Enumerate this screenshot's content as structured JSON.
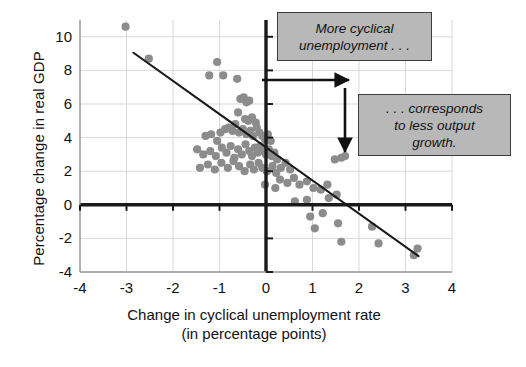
{
  "chart_data": {
    "type": "scatter",
    "title": "",
    "xlabel": "Change in cyclical unemployment rate (in percentage points)",
    "xlabel_line1": "Change in cyclical unemployment rate",
    "xlabel_line2": "(in percentage points)",
    "ylabel": "Percentage change in real GDP",
    "xlim": [
      -4,
      4
    ],
    "ylim": [
      -4,
      11
    ],
    "xticks": [
      -4,
      -3,
      -2,
      -1,
      0,
      1,
      2,
      3,
      4
    ],
    "xtick_labels": [
      "-4",
      "-3",
      "-2",
      "-1",
      "0",
      "1",
      "2",
      "3",
      "4"
    ],
    "yticks": [
      -4,
      -2,
      0,
      2,
      4,
      6,
      8,
      10
    ],
    "ytick_labels": [
      "-4",
      "-2",
      "0",
      "2",
      "4",
      "6",
      "8",
      "10"
    ],
    "grid": true,
    "legend": "none",
    "point_color": "#8c8c8c",
    "line_color": "#1a1a1a",
    "axis_color": "#1a1a1a",
    "grid_color": "#d9d9d9",
    "points": [
      [
        -3.02,
        10.6
      ],
      [
        -2.52,
        8.7
      ],
      [
        -1.05,
        8.5
      ],
      [
        -1.22,
        7.7
      ],
      [
        -0.92,
        7.7
      ],
      [
        -0.62,
        7.5
      ],
      [
        -0.55,
        6.3
      ],
      [
        -0.48,
        6.4
      ],
      [
        -0.42,
        6.1
      ],
      [
        -0.36,
        6.2
      ],
      [
        -0.6,
        5.5
      ],
      [
        -0.45,
        5.1
      ],
      [
        -0.38,
        5.0
      ],
      [
        -0.3,
        5.2
      ],
      [
        -0.22,
        4.9
      ],
      [
        -1.3,
        4.1
      ],
      [
        -1.18,
        4.2
      ],
      [
        -1.05,
        3.8
      ],
      [
        -0.98,
        4.3
      ],
      [
        -0.88,
        4.5
      ],
      [
        -0.8,
        4.6
      ],
      [
        -0.72,
        4.4
      ],
      [
        -0.66,
        4.8
      ],
      [
        -0.58,
        4.3
      ],
      [
        -0.5,
        4.5
      ],
      [
        -0.42,
        4.2
      ],
      [
        -0.34,
        4.4
      ],
      [
        -0.28,
        4.1
      ],
      [
        -0.2,
        4.6
      ],
      [
        -0.14,
        4.3
      ],
      [
        -0.08,
        4.1
      ],
      [
        -0.02,
        3.9
      ],
      [
        0.04,
        4.2
      ],
      [
        0.1,
        3.8
      ],
      [
        -1.48,
        3.3
      ],
      [
        -1.35,
        3.0
      ],
      [
        -1.2,
        3.2
      ],
      [
        -1.08,
        2.9
      ],
      [
        -0.95,
        3.4
      ],
      [
        -0.85,
        3.1
      ],
      [
        -0.76,
        3.5
      ],
      [
        -0.68,
        2.8
      ],
      [
        -0.6,
        3.3
      ],
      [
        -0.52,
        3.0
      ],
      [
        -0.44,
        3.6
      ],
      [
        -0.36,
        3.2
      ],
      [
        -0.3,
        2.9
      ],
      [
        -0.24,
        3.4
      ],
      [
        -0.18,
        3.1
      ],
      [
        -0.12,
        3.5
      ],
      [
        -0.06,
        3.2
      ],
      [
        0.0,
        3.0
      ],
      [
        0.06,
        3.3
      ],
      [
        0.12,
        2.9
      ],
      [
        0.18,
        3.1
      ],
      [
        0.24,
        2.7
      ],
      [
        -1.42,
        2.2
      ],
      [
        -1.25,
        2.4
      ],
      [
        -1.1,
        2.1
      ],
      [
        -0.96,
        2.5
      ],
      [
        -0.82,
        2.2
      ],
      [
        -0.7,
        2.6
      ],
      [
        -0.58,
        2.3
      ],
      [
        -0.46,
        2.0
      ],
      [
        -0.34,
        2.4
      ],
      [
        -0.26,
        2.1
      ],
      [
        -0.16,
        2.5
      ],
      [
        -0.08,
        2.2
      ],
      [
        0.02,
        2.0
      ],
      [
        0.14,
        2.3
      ],
      [
        0.22,
        1.9
      ],
      [
        0.32,
        2.2
      ],
      [
        0.42,
        2.5
      ],
      [
        0.52,
        2.1
      ],
      [
        0.3,
        1.5
      ],
      [
        0.46,
        1.3
      ],
      [
        0.6,
        1.6
      ],
      [
        0.72,
        1.2
      ],
      [
        0.88,
        1.4
      ],
      [
        1.02,
        1.0
      ],
      [
        1.18,
        0.9
      ],
      [
        1.32,
        1.2
      ],
      [
        1.48,
        2.7
      ],
      [
        1.62,
        2.8
      ],
      [
        1.7,
        2.9
      ],
      [
        1.52,
        0.6
      ],
      [
        1.35,
        0.4
      ],
      [
        0.88,
        0.3
      ],
      [
        1.22,
        -0.5
      ],
      [
        0.95,
        -0.7
      ],
      [
        1.05,
        -1.4
      ],
      [
        1.55,
        -1.1
      ],
      [
        2.28,
        -1.3
      ],
      [
        1.62,
        -2.2
      ],
      [
        2.42,
        -2.3
      ],
      [
        3.18,
        -3.0
      ],
      [
        3.26,
        -2.6
      ],
      [
        0.62,
        0.2
      ],
      [
        0.2,
        1.0
      ],
      [
        -0.02,
        1.2
      ]
    ],
    "trend_line": {
      "x1": -2.85,
      "y1": 9.05,
      "x2": 3.28,
      "y2": -3.05
    },
    "annotations": [
      {
        "name": "more-cyclical-unemployment",
        "text": "More cyclical unemployment . . .",
        "line1": "More cyclical",
        "line2": "unemployment . . ."
      },
      {
        "name": "corresponds-to-less-output-growth",
        "text": ". . . corresponds to less output growth.",
        "line1": ". . . corresponds",
        "line2": "to less output",
        "line3": "growth."
      }
    ]
  },
  "axes": {
    "ylabel": "Percentage change in real GDP",
    "xlabel_line1": "Change in cyclical unemployment rate",
    "xlabel_line2": "(in percentage points)"
  },
  "callouts": {
    "first": {
      "line1": "More cyclical",
      "line2": "unemployment . . ."
    },
    "second": {
      "line1": ". . . corresponds",
      "line2": "to less output",
      "line3": "growth."
    }
  }
}
